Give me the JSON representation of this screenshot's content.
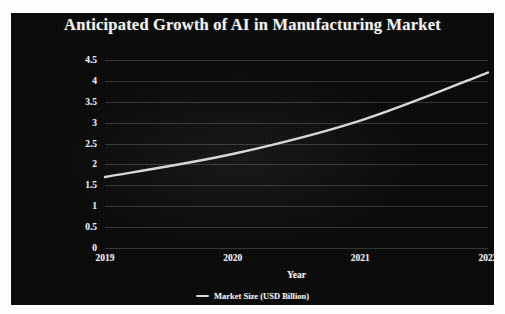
{
  "chart_data": {
    "type": "line",
    "title": "Anticipated Growth of AI in Manufacturing Market",
    "xlabel": "Year",
    "ylabel": "MARKET SIZE(USD billion)",
    "categories": [
      "2019",
      "2020",
      "2021",
      "2022"
    ],
    "x": [
      2019,
      2020,
      2021,
      2022
    ],
    "series": [
      {
        "name": "Market Size (USD Billion)",
        "values": [
          1.7,
          2.25,
          3.05,
          4.2
        ],
        "color": "#d8d8d8"
      }
    ],
    "ylim": [
      0,
      4.5
    ],
    "y_ticks": [
      "0",
      "0.5",
      "1",
      "1.5",
      "2",
      "2.5",
      "3",
      "3.5",
      "4",
      "4.5"
    ],
    "y_tick_values": [
      0,
      0.5,
      1,
      1.5,
      2,
      2.5,
      3,
      3.5,
      4,
      4.5
    ],
    "grid": "horizontal",
    "legend_position": "bottom",
    "legend_entries": [
      "Market Size (USD Billion)"
    ],
    "background_color": "#0a0a0a",
    "text_color": "#f0f0f0",
    "grid_color": "#e1e1e1"
  },
  "legend": {
    "marker_name": "line-marker",
    "label": "Market Size (USD Billion)"
  }
}
